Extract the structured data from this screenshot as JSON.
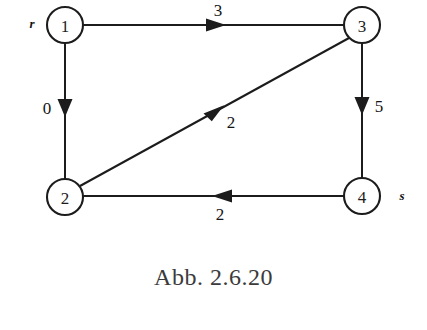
{
  "figure": {
    "caption": "Abb. 2.6.20",
    "background_color": "#ffffff",
    "ink_color": "#1c1c1c",
    "caption_color": "#3b3b3b"
  },
  "graph": {
    "type": "directed-weighted-graph",
    "nodes": [
      {
        "id": "n1",
        "label": "1",
        "x": 65,
        "y": 25,
        "r": 18,
        "terminal_label": "r",
        "terminal_x": 32,
        "terminal_y": 23
      },
      {
        "id": "n3",
        "label": "3",
        "x": 362,
        "y": 25,
        "r": 18,
        "terminal_label": "",
        "terminal_x": 0,
        "terminal_y": 0
      },
      {
        "id": "n2",
        "label": "2",
        "x": 65,
        "y": 197,
        "r": 18,
        "terminal_label": "",
        "terminal_x": 0,
        "terminal_y": 0
      },
      {
        "id": "n4",
        "label": "4",
        "x": 362,
        "y": 196,
        "r": 18,
        "terminal_label": "s",
        "terminal_x": 402,
        "terminal_y": 195
      }
    ],
    "edges": [
      {
        "id": "e1-3",
        "from": "n1",
        "to": "n3",
        "weight": "3",
        "direction": "right",
        "label_x": 218,
        "label_y": 10,
        "arrow_x": 218,
        "arrow_y": 25
      },
      {
        "id": "e1-2",
        "from": "n1",
        "to": "n2",
        "weight": "0",
        "direction": "down",
        "label_x": 47,
        "label_y": 108,
        "arrow_x": 65,
        "arrow_y": 109
      },
      {
        "id": "e2-3",
        "from": "n2",
        "to": "n3",
        "weight": "2",
        "direction": "diagonal-up-right",
        "label_x": 231,
        "label_y": 122,
        "arrow_x": 216,
        "arrow_y": 112
      },
      {
        "id": "e3-4",
        "from": "n3",
        "to": "n4",
        "weight": "5",
        "direction": "down",
        "label_x": 379,
        "label_y": 106,
        "arrow_x": 362,
        "arrow_y": 107
      },
      {
        "id": "e4-2",
        "from": "n4",
        "to": "n2",
        "weight": "2",
        "direction": "left",
        "label_x": 220,
        "label_y": 214,
        "arrow_x": 220,
        "arrow_y": 196
      }
    ]
  }
}
